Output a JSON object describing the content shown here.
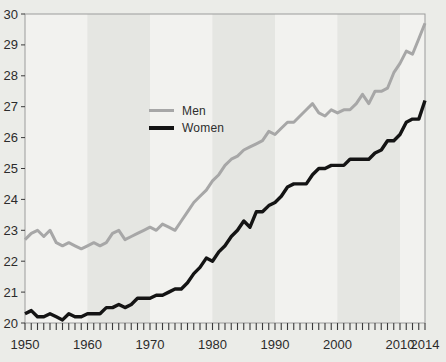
{
  "figure": {
    "page_background": "#ebece8",
    "title": ""
  },
  "chart_data": {
    "type": "line",
    "title": "",
    "xlabel": "",
    "ylabel": "",
    "xlim": [
      1950,
      2014
    ],
    "ylim": [
      20,
      30
    ],
    "grid": false,
    "x": [
      1950,
      1951,
      1952,
      1953,
      1954,
      1955,
      1956,
      1957,
      1958,
      1959,
      1960,
      1961,
      1962,
      1963,
      1964,
      1965,
      1966,
      1967,
      1968,
      1969,
      1970,
      1971,
      1972,
      1973,
      1974,
      1975,
      1976,
      1977,
      1978,
      1979,
      1980,
      1981,
      1982,
      1983,
      1984,
      1985,
      1986,
      1987,
      1988,
      1989,
      1990,
      1991,
      1992,
      1993,
      1994,
      1995,
      1996,
      1997,
      1998,
      1999,
      2000,
      2001,
      2002,
      2003,
      2004,
      2005,
      2006,
      2007,
      2008,
      2009,
      2010,
      2011,
      2012,
      2013,
      2014
    ],
    "series": [
      {
        "name": "Men",
        "color": "#a7a7a7",
        "stroke_width": 3,
        "values": [
          22.7,
          22.9,
          23.0,
          22.8,
          23.0,
          22.6,
          22.5,
          22.6,
          22.5,
          22.4,
          22.5,
          22.6,
          22.5,
          22.6,
          22.9,
          23.0,
          22.7,
          22.8,
          22.9,
          23.0,
          23.1,
          23.0,
          23.2,
          23.1,
          23.0,
          23.3,
          23.6,
          23.9,
          24.1,
          24.3,
          24.6,
          24.8,
          25.1,
          25.3,
          25.4,
          25.6,
          25.7,
          25.8,
          25.9,
          26.2,
          26.1,
          26.3,
          26.5,
          26.5,
          26.7,
          26.9,
          27.1,
          26.8,
          26.7,
          26.9,
          26.8,
          26.9,
          26.9,
          27.1,
          27.4,
          27.1,
          27.5,
          27.5,
          27.6,
          28.1,
          28.4,
          28.8,
          28.7,
          29.2,
          29.7
        ]
      },
      {
        "name": "Women",
        "color": "#141414",
        "stroke_width": 3.4,
        "values": [
          20.3,
          20.4,
          20.2,
          20.2,
          20.3,
          20.2,
          20.1,
          20.3,
          20.2,
          20.2,
          20.3,
          20.3,
          20.3,
          20.5,
          20.5,
          20.6,
          20.5,
          20.6,
          20.8,
          20.8,
          20.8,
          20.9,
          20.9,
          21.0,
          21.1,
          21.1,
          21.3,
          21.6,
          21.8,
          22.1,
          22.0,
          22.3,
          22.5,
          22.8,
          23.0,
          23.3,
          23.1,
          23.6,
          23.6,
          23.8,
          23.9,
          24.1,
          24.4,
          24.5,
          24.5,
          24.5,
          24.8,
          25.0,
          25.0,
          25.1,
          25.1,
          25.1,
          25.3,
          25.3,
          25.3,
          25.3,
          25.5,
          25.6,
          25.9,
          25.9,
          26.1,
          26.5,
          26.6,
          26.6,
          27.2
        ]
      }
    ],
    "x_tick_labels": [
      "1950",
      "1960",
      "1970",
      "1980",
      "1990",
      "2000",
      "2010",
      "2014"
    ],
    "x_tick_positions": [
      1950,
      1960,
      1970,
      1980,
      1990,
      2000,
      2010,
      2014
    ],
    "minor_x_tick_step": 1,
    "y_tick_labels": [
      "20",
      "21",
      "22",
      "23",
      "24",
      "25",
      "26",
      "27",
      "28",
      "29",
      "30"
    ],
    "y_tick_positions": [
      20,
      21,
      22,
      23,
      24,
      25,
      26,
      27,
      28,
      29,
      30
    ],
    "decade_bands": {
      "start_year": 1950,
      "band_years": 10,
      "light": "#f2f2ef",
      "dark": "#e5e6e2"
    },
    "frame_color": "#9b9b9b",
    "tick_color": "#3a3a3a",
    "label_color": "#2b2b2b",
    "legend": {
      "position": "inside-center-left",
      "entries": [
        {
          "label": "Men",
          "color": "#a7a7a7"
        },
        {
          "label": "Women",
          "color": "#141414"
        }
      ]
    }
  }
}
